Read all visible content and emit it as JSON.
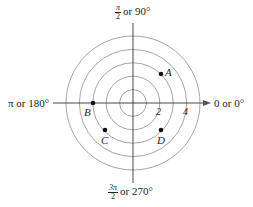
{
  "diagram": {
    "type": "polar-coordinate-grid",
    "center": [
      133,
      103
    ],
    "circle_radii_units": [
      1,
      2,
      3,
      4,
      5
    ],
    "unit_px": 13.4,
    "axis_labels": {
      "top": {
        "frac_num": "π",
        "frac_den": "2",
        "text": "or 90°"
      },
      "left": {
        "text": "π or 180°"
      },
      "right": {
        "text": "0 or 0°"
      },
      "bottom": {
        "frac_num": "3π",
        "frac_den": "2",
        "text": "or 270°"
      }
    },
    "tick_labels": [
      {
        "label": "2",
        "r": 2
      },
      {
        "label": "4",
        "r": 4
      }
    ],
    "points": [
      {
        "label": "A",
        "x": 161,
        "y": 74
      },
      {
        "label": "B",
        "x": 93,
        "y": 103
      },
      {
        "label": "C",
        "x": 105,
        "y": 130
      },
      {
        "label": "D",
        "x": 161,
        "y": 130
      }
    ],
    "colors": {
      "circle": "#9a9a9a",
      "axis": "#333333",
      "point": "#111111"
    }
  }
}
